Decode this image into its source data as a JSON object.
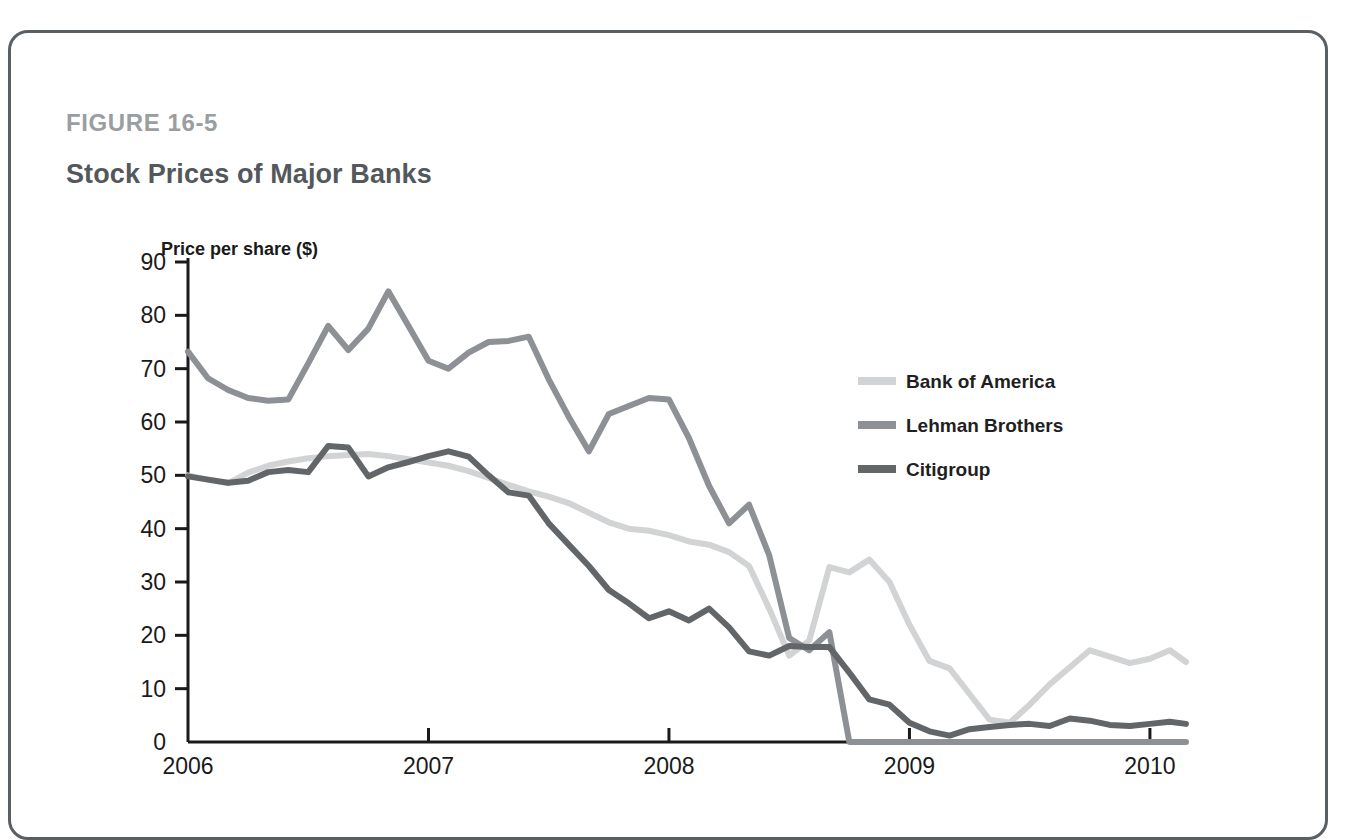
{
  "figure": {
    "label": "FIGURE 16-5",
    "title": "Stock Prices of Major Banks"
  },
  "chart_data": {
    "type": "line",
    "title": "Stock Prices of Major Banks",
    "xlabel": "",
    "ylabel": "Price per share ($)",
    "ylim": [
      0,
      90
    ],
    "xlim": [
      2006.0,
      2010.15
    ],
    "yticks": [
      0,
      10,
      20,
      30,
      40,
      50,
      60,
      70,
      80,
      90
    ],
    "xticks": [
      2006,
      2007,
      2008,
      2009,
      2010
    ],
    "xtick_labels": [
      "2006",
      "2007",
      "2008",
      "2009",
      "2010"
    ],
    "grid": false,
    "legend_position": "inside-right",
    "colors": {
      "bank_of_america": "#d2d3d4",
      "lehman_brothers": "#8d9094",
      "citigroup": "#626669",
      "axis": "#1a1a1a",
      "border": "#5a5f63",
      "figure_label": "#9a9ea1",
      "title": "#53585c"
    },
    "x": [
      2006.0,
      2006.083,
      2006.167,
      2006.25,
      2006.333,
      2006.417,
      2006.5,
      2006.583,
      2006.667,
      2006.75,
      2006.833,
      2006.917,
      2007.0,
      2007.083,
      2007.167,
      2007.25,
      2007.333,
      2007.417,
      2007.5,
      2007.583,
      2007.667,
      2007.75,
      2007.833,
      2007.917,
      2008.0,
      2008.083,
      2008.167,
      2008.25,
      2008.333,
      2008.417,
      2008.5,
      2008.583,
      2008.667,
      2008.75,
      2008.833,
      2008.917,
      2009.0,
      2009.083,
      2009.167,
      2009.25,
      2009.333,
      2009.417,
      2009.5,
      2009.583,
      2009.667,
      2009.75,
      2009.833,
      2009.917,
      2010.0,
      2010.083,
      2010.15
    ],
    "series": [
      {
        "name": "Bank of America",
        "color": "#d2d3d4",
        "values": [
          50.0,
          49.2,
          48.5,
          50.5,
          51.8,
          52.6,
          53.2,
          53.6,
          53.8,
          54.0,
          53.6,
          53.0,
          52.4,
          51.8,
          50.8,
          49.5,
          48.2,
          47.0,
          46.0,
          44.8,
          43.0,
          41.2,
          40.0,
          39.6,
          38.8,
          37.6,
          37.0,
          35.6,
          33.0,
          25.0,
          16.2,
          19.0,
          32.8,
          31.8,
          34.2,
          30.0,
          22.0,
          15.2,
          13.8,
          9.0,
          4.2,
          3.6,
          7.0,
          10.8,
          14.0,
          17.2,
          16.0,
          14.8,
          15.6,
          17.2,
          15.0
        ]
      },
      {
        "name": "Lehman Brothers",
        "color": "#8d9094",
        "values": [
          73.2,
          68.2,
          66.0,
          64.5,
          64.0,
          64.2,
          71.0,
          78.0,
          73.5,
          77.5,
          84.5,
          78.0,
          71.5,
          70.0,
          73.0,
          75.0,
          75.2,
          76.0,
          68.0,
          61.0,
          54.5,
          61.5,
          63.0,
          64.5,
          64.2,
          57.0,
          48.0,
          41.0,
          44.5,
          35.0,
          19.5,
          17.2,
          20.6,
          0.0,
          0.0,
          0.0,
          0.0,
          0.0,
          0.0,
          0.0,
          0.0,
          0.0,
          0.0,
          0.0,
          0.0,
          0.0,
          0.0,
          0.0,
          0.0,
          0.0,
          0.0
        ]
      },
      {
        "name": "Citigroup",
        "color": "#626669",
        "values": [
          49.8,
          49.2,
          48.6,
          49.0,
          50.6,
          51.0,
          50.6,
          55.5,
          55.2,
          49.8,
          51.5,
          52.5,
          53.6,
          54.5,
          53.5,
          50.0,
          46.8,
          46.2,
          41.0,
          37.0,
          33.0,
          28.5,
          26.0,
          23.2,
          24.5,
          22.8,
          25.0,
          21.5,
          17.0,
          16.2,
          18.0,
          17.8,
          17.8,
          13.0,
          8.0,
          7.0,
          3.6,
          2.0,
          1.2,
          2.4,
          2.8,
          3.2,
          3.4,
          3.0,
          4.4,
          4.0,
          3.2,
          3.0,
          3.4,
          3.8,
          3.4
        ]
      }
    ],
    "annotations": [
      {
        "text": "Lehman Brothers share price falls to zero in September 2008",
        "x": 2008.72,
        "y": 0
      }
    ]
  },
  "legend": {
    "items": [
      {
        "label": "Bank of America",
        "color": "#d2d3d4"
      },
      {
        "label": "Lehman Brothers",
        "color": "#8d9094"
      },
      {
        "label": "Citigroup",
        "color": "#626669"
      }
    ]
  }
}
